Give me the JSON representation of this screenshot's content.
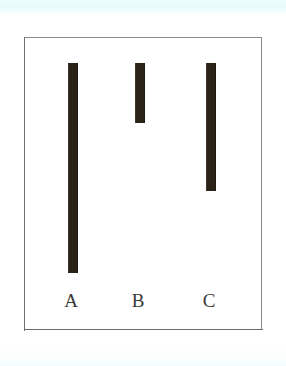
{
  "figure": {
    "background_color": "#ffffff",
    "frame": {
      "border_color": "#8a8a8a",
      "left": 24,
      "top": 37,
      "width": 238,
      "height": 293
    },
    "bar_color": "#2c2318",
    "label_color": "#3c3a38"
  },
  "chart_data": {
    "type": "bar",
    "orientation": "vertical-hanging",
    "title": "",
    "subtitle": "",
    "xlabel": "",
    "ylabel": "",
    "grid": false,
    "legend": null,
    "axis_visible": false,
    "note": "Three vertical dark bars suspended from a common top line, each a different length; labelled A, B, C beneath.",
    "categories": [
      "A",
      "B",
      "C"
    ],
    "values": [
      210,
      60,
      128
    ],
    "value_unit": "px-length",
    "ylim": [
      0,
      293
    ],
    "bars": [
      {
        "label": "A",
        "x": 67,
        "top": 62,
        "bottom": 272,
        "length": 210,
        "width": 10,
        "color": "#2c2318",
        "label_x": 66,
        "label_y": 291
      },
      {
        "label": "B",
        "x": 134,
        "top": 62,
        "bottom": 122,
        "length": 60,
        "width": 10,
        "color": "#2c2318",
        "label_x": 133,
        "label_y": 291
      },
      {
        "label": "C",
        "x": 205,
        "top": 62,
        "bottom": 190,
        "length": 128,
        "width": 10,
        "color": "#2c2318",
        "label_x": 204,
        "label_y": 291
      }
    ]
  }
}
